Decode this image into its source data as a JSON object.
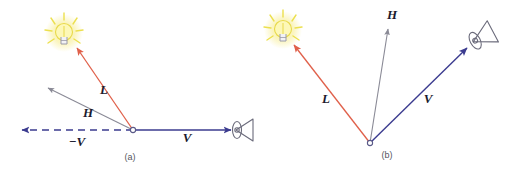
{
  "figure": {
    "background_color": "#ffffff",
    "panels": [
      {
        "id": "a",
        "caption": "(a)",
        "caption_pos": [
          130,
          160
        ],
        "origin": [
          133,
          130
        ],
        "origin_marker": "open-circle",
        "light_icon": {
          "name": "light-bulb-icon",
          "pos": [
            64,
            36
          ],
          "glow_color": "#f2e34a",
          "body_color": "#9a9aa8"
        },
        "eye_icon": {
          "name": "eye-icon",
          "pos": [
            239,
            129
          ],
          "rotation": 0,
          "color": "#6b6b7b"
        },
        "vectors": [
          {
            "name": "L",
            "label": "L",
            "label_pos": [
              104,
              94
            ],
            "from": [
              133,
              130
            ],
            "to": [
              75,
              46
            ],
            "color": "#e0604a",
            "style": "solid",
            "arrow": "end"
          },
          {
            "name": "H",
            "label": "H",
            "label_pos": [
              88,
              117
            ],
            "from": [
              133,
              130
            ],
            "to": [
              46,
              87
            ],
            "color": "#8a8a96",
            "style": "solid",
            "arrow": "end"
          },
          {
            "name": "V",
            "label": "V",
            "label_pos": [
              187,
              142
            ],
            "from": [
              133,
              130
            ],
            "to": [
              229,
              130
            ],
            "color": "#3b3b8f",
            "style": "solid",
            "arrow": "end"
          },
          {
            "name": "-V",
            "label": "−V",
            "label_pos": [
              77,
              146
            ],
            "from": [
              133,
              130
            ],
            "to": [
              20,
              130
            ],
            "color": "#3b3b8f",
            "style": "dashed",
            "arrow": "end"
          }
        ]
      },
      {
        "id": "b",
        "caption": "(b)",
        "caption_pos": [
          387,
          158
        ],
        "origin": [
          370,
          143
        ],
        "origin_marker": "open-circle",
        "light_icon": {
          "name": "light-bulb-icon",
          "pos": [
            283,
            33
          ],
          "glow_color": "#f2e34a",
          "body_color": "#9a9aa8"
        },
        "eye_icon": {
          "name": "eye-icon",
          "pos": [
            484,
            36
          ],
          "rotation": -28,
          "color": "#6b6b7b"
        },
        "vectors": [
          {
            "name": "L",
            "label": "L",
            "label_pos": [
              326,
              103
            ],
            "from": [
              370,
              143
            ],
            "to": [
              296,
              47
            ],
            "color": "#e0604a",
            "style": "solid",
            "arrow": "end"
          },
          {
            "name": "H",
            "label": "H",
            "label_pos": [
              389,
              19
            ],
            "from": [
              370,
              143
            ],
            "to": [
              388,
              31
            ],
            "color": "#8a8a96",
            "style": "solid",
            "arrow": "end"
          },
          {
            "name": "V",
            "label": "V",
            "label_pos": [
              428,
              103
            ],
            "from": [
              370,
              143
            ],
            "to": [
              465,
              50
            ],
            "color": "#3b3b8f",
            "style": "solid",
            "arrow": "end"
          }
        ]
      }
    ]
  }
}
